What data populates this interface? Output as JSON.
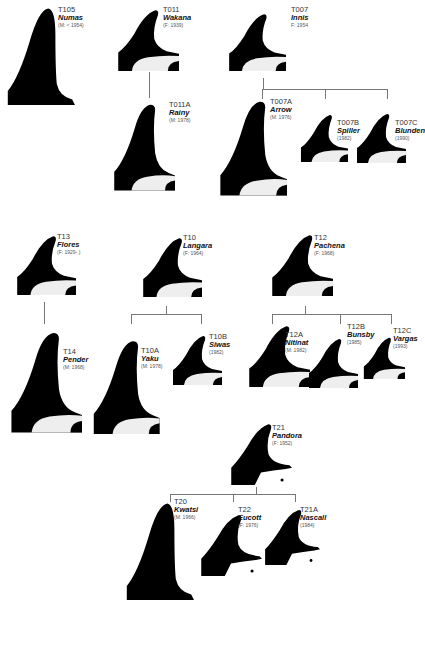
{
  "colors": {
    "fin": "#000000",
    "saddle": "#eeeeee",
    "line": "#777777",
    "background": "#ffffff"
  },
  "whales": {
    "T105": {
      "id": "T105",
      "name": "Numas",
      "info": "(M: < 1954)"
    },
    "T011": {
      "id": "T011",
      "name": "Wakana",
      "info": "(F: 1939)"
    },
    "T011A": {
      "id": "T011A",
      "name": "Rainy",
      "info": "(M: 1978)"
    },
    "T007": {
      "id": "T007",
      "name": "Innis",
      "info": "F: 1954"
    },
    "T007A": {
      "id": "T007A",
      "name": "Arrow",
      "info": "(M: 1976)"
    },
    "T007B": {
      "id": "T007B",
      "name": "Spiller",
      "info": "(1982)"
    },
    "T007C": {
      "id": "T007C",
      "name": "Blunden",
      "info": "(1990)"
    },
    "T13": {
      "id": "T13",
      "name": "Flores",
      "info": "(F: 1929- )"
    },
    "T14": {
      "id": "T14",
      "name": "Pender",
      "info": "(M: 1968)"
    },
    "T10": {
      "id": "T10",
      "name": "Langara",
      "info": "(F: 1964)"
    },
    "T10A": {
      "id": "T10A",
      "name": "Yaku",
      "info": "(M: 1978)"
    },
    "T10B": {
      "id": "T10B",
      "name": "Siwas",
      "info": "(1982)"
    },
    "T12": {
      "id": "T12",
      "name": "Pachena",
      "info": "(F: 1968)"
    },
    "T12A": {
      "id": "T12A",
      "name": "Nitinat",
      "info": "(M: 1982)"
    },
    "T12B": {
      "id": "T12B",
      "name": "Bunsby",
      "info": "(1985)"
    },
    "T12C": {
      "id": "T12C",
      "name": "Vargas",
      "info": "(1993)"
    },
    "T21": {
      "id": "T21",
      "name": "Pandora",
      "info": "(F: 1952)"
    },
    "T20": {
      "id": "T20",
      "name": "Kwatsi",
      "info": "(M: 1966)"
    },
    "T22": {
      "id": "T22",
      "name": "Eucott",
      "info": "(F: 1976)"
    },
    "T21A": {
      "id": "T21A",
      "name": "Nascall",
      "info": "(1984)"
    }
  },
  "families": [
    {
      "mother": "T011",
      "offspring": [
        "T011A"
      ]
    },
    {
      "mother": "T007",
      "offspring": [
        "T007A",
        "T007B",
        "T007C"
      ]
    },
    {
      "mother": "T13",
      "offspring": [
        "T14"
      ]
    },
    {
      "mother": "T10",
      "offspring": [
        "T10A",
        "T10B"
      ]
    },
    {
      "mother": "T12",
      "offspring": [
        "T12A",
        "T12B",
        "T12C"
      ]
    },
    {
      "mother": "T21",
      "offspring": [
        "T20",
        "T22",
        "T21A"
      ]
    }
  ]
}
